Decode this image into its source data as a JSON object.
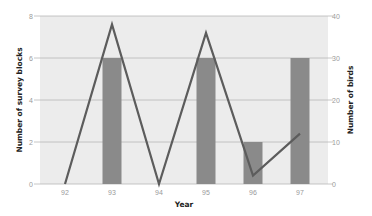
{
  "chart_data": {
    "type": "bar",
    "title": "",
    "xlabel": "Year",
    "ylabel": "Number of survey blocks",
    "y2label": "Number of birds",
    "categories": [
      "92",
      "93",
      "94",
      "95",
      "96",
      "97"
    ],
    "series": [
      {
        "name": "Number of survey blocks",
        "type": "bar",
        "axis": "left",
        "values": [
          0,
          6,
          0,
          6,
          2,
          6
        ],
        "color": "#8a8a8a"
      },
      {
        "name": "Number of birds",
        "type": "line",
        "axis": "right",
        "values": [
          0,
          38,
          0,
          36,
          2,
          12
        ],
        "color": "#5c5c5c"
      }
    ],
    "ylim": [
      0,
      8
    ],
    "y2lim": [
      0,
      40
    ],
    "yticks": [
      "0",
      "2",
      "4",
      "6",
      "8"
    ],
    "y2ticks": [
      "0",
      "10",
      "20",
      "30",
      "40"
    ],
    "grid": true,
    "legend": "none",
    "background": "#ececec",
    "gridline_color": "#b8b8b8"
  }
}
